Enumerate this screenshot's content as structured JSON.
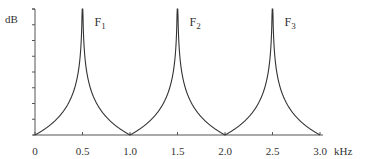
{
  "chart_data": {
    "type": "line",
    "title": "",
    "xlabel": "kHz",
    "ylabel": "dB",
    "xlim": [
      0,
      3.0
    ],
    "x_ticks": [
      "0",
      "0.5",
      "1.0",
      "1.5",
      "2.0",
      "2.5",
      "3.0"
    ],
    "y_ticks_count": 9,
    "y_tick_labels": [],
    "grid": false,
    "legend": null,
    "series": [
      {
        "name": "resonance response",
        "description": "Sharp resonance peaks at odd multiples of 0.5 kHz, minima at 0, 1.0, 2.0, 3.0 kHz",
        "peaks_khz": [
          0.5,
          1.5,
          2.5
        ],
        "minima_khz": [
          0,
          1.0,
          2.0,
          3.0
        ]
      }
    ],
    "annotations": [
      {
        "text": "F",
        "sub": "1",
        "x_khz": 0.5
      },
      {
        "text": "F",
        "sub": "2",
        "x_khz": 1.5
      },
      {
        "text": "F",
        "sub": "3",
        "x_khz": 2.5
      }
    ]
  },
  "labels": {
    "y_axis": "dB",
    "x_unit": "kHz",
    "formants": [
      {
        "main": "F",
        "sub": "1"
      },
      {
        "main": "F",
        "sub": "2"
      },
      {
        "main": "F",
        "sub": "3"
      }
    ]
  },
  "colors": {
    "line": "#333333",
    "axis": "#555555"
  }
}
